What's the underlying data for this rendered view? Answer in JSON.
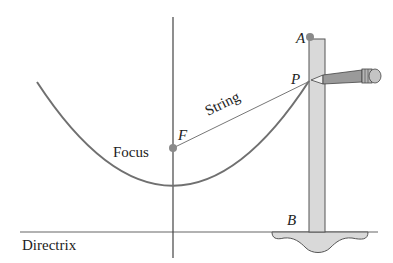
{
  "diagram": {
    "title": "",
    "labels": {
      "point_a": "A",
      "point_p": "P",
      "point_b": "B",
      "point_f": "F",
      "focus": "Focus",
      "string": "String",
      "directrix": "Directrix"
    },
    "colors": {
      "curve": "#707070",
      "line": "#555555",
      "ruler_fill": "#d9d9d9",
      "point": "#8a8a8a",
      "text": "#222222"
    }
  }
}
